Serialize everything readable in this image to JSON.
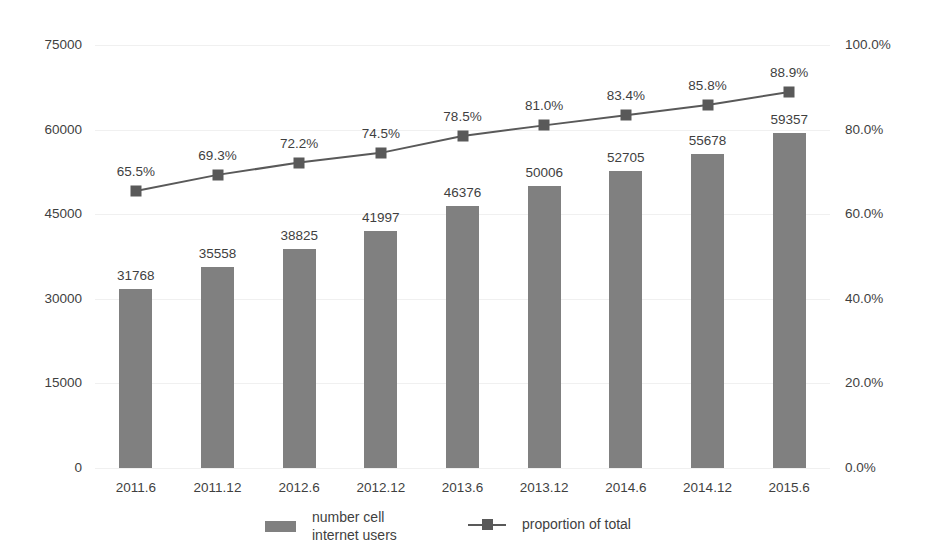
{
  "chart_data": {
    "type": "bar",
    "title": "",
    "subtitle": "",
    "xlabel": "",
    "ylabel": "",
    "grid": true,
    "legend_position": "bottom",
    "categories": [
      "2011.6",
      "2011.12",
      "2012.6",
      "2012.12",
      "2013.6",
      "2013.12",
      "2014.6",
      "2014.12",
      "2015.6"
    ],
    "series": [
      {
        "name": "number cell\ninternet users",
        "type": "bar",
        "axis": "left",
        "color": "#808080",
        "values": [
          31768,
          35558,
          38825,
          41997,
          46376,
          50006,
          52705,
          55678,
          59357
        ],
        "value_labels": [
          "31768",
          "35558",
          "38825",
          "41997",
          "46376",
          "50006",
          "52705",
          "55678",
          "59357"
        ]
      },
      {
        "name": "proportion of total",
        "type": "line",
        "axis": "right",
        "color": "#595959",
        "marker": "square",
        "values": [
          65.5,
          69.3,
          72.2,
          74.5,
          78.5,
          81.0,
          83.4,
          85.8,
          88.9
        ],
        "value_labels": [
          "65.5%",
          "69.3%",
          "72.2%",
          "74.5%",
          "78.5%",
          "81.0%",
          "83.4%",
          "85.8%",
          "88.9%"
        ]
      }
    ],
    "left_axis": {
      "min": 0,
      "max": 75000,
      "ticks": [
        0,
        15000,
        30000,
        45000,
        60000,
        75000
      ],
      "tick_labels": [
        "0",
        "15000",
        "30000",
        "45000",
        "60000",
        "75000"
      ]
    },
    "right_axis": {
      "min": 0,
      "max": 100,
      "ticks": [
        0,
        20,
        40,
        60,
        80,
        100
      ],
      "tick_labels": [
        "0.0%",
        "20.0%",
        "40.0%",
        "60.0%",
        "80.0%",
        "100.0%"
      ]
    }
  },
  "legend": {
    "entries": [
      {
        "label": "number cell\ninternet users",
        "marker": "bar-swatch",
        "color": "#808080"
      },
      {
        "label": "proportion of total",
        "marker": "line-marker",
        "color": "#595959"
      }
    ]
  },
  "colors": {
    "bar": "#808080",
    "line": "#595959",
    "gridline": "#f0f0f0",
    "text": "#3f3f3f",
    "background": "#ffffff"
  }
}
